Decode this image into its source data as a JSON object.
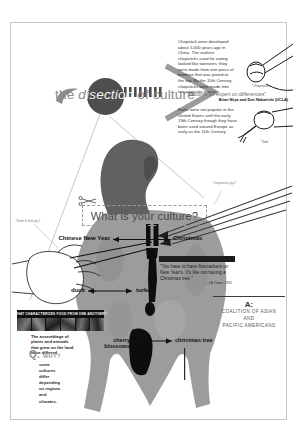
{
  "accent_colors": {
    "circle": "#4e4e4e",
    "body_gray": "#9c9c9c",
    "head_gray": "#616161",
    "ink": "#121212"
  },
  "title": {
    "pre": "the ",
    "emph_prefix": "d",
    "emph_knockout": "isection",
    "post": " of culture"
  },
  "chopsticks_note": {
    "text": "Chopstick were developed about 5,000 years ago in China. The earliest chopsticks used for eating looked like tweezers; they were made from one piece of bamboo that was joined at the top. By the 10th Century, chopsticks were made into two separate pieces.",
    "caption": "*chopsticks"
  },
  "quote1": {
    "text": "\"become an expert on differences\"",
    "attribution": "Brian Niiya and Don Nakanishi (UCLA)"
  },
  "forks_note": {
    "text": "Forks were not popular in the United States until the early 19th Century though they have been used around Europe as early as the 11th Century.",
    "caption": "*fork"
  },
  "question_box": {
    "label": "What is your culture?"
  },
  "micro_labels": {
    "right": "*chopsticks pg 2",
    "left": "*knife & fork pg 2"
  },
  "comparisons": [
    {
      "left": "Chinese New Year",
      "right": "Christmas"
    },
    {
      "left": "duck",
      "right": "turkey"
    },
    {
      "left": "cherry blossoms",
      "right": "christmas tree"
    }
  ],
  "quote2": {
    "text": "\"You have to have firecrackers on New Year's. It's like not having a Christmas tree.\"",
    "attribution": "—LA Times, 1992"
  },
  "food_section": {
    "header": "WHAT CHARACTERIZES FOOD FROM ONE ANOTHER?",
    "body": "The assemblage of plants and animals that grew on the land, have differed",
    "q_label": "Q:",
    "q_word": "WHY?",
    "q_answer": "some cultures differ depending on regions and climates."
  },
  "answer_block": {
    "a_label": "A:",
    "line1": "COALITION OF ASIAN",
    "line2": "AND",
    "line3": "PACIFIC AMERICANS"
  }
}
